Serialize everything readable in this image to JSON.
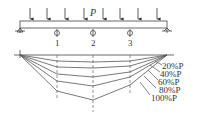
{
  "diagram": {
    "type": "beam-deflection",
    "load_label": "P",
    "point_labels": [
      "1",
      "2",
      "3"
    ],
    "curve_labels": [
      "20%P",
      "40%P",
      "60%P",
      "80%P",
      "100%P"
    ],
    "line_color": "#555555",
    "curves": [
      {
        "label": "20%P",
        "depths": [
          6,
          7,
          6
        ]
      },
      {
        "label": "40%P",
        "depths": [
          12,
          13,
          11
        ]
      },
      {
        "label": "60%P",
        "depths": [
          19,
          22,
          17
        ]
      },
      {
        "label": "80%P",
        "depths": [
          26,
          31,
          22
        ]
      },
      {
        "label": "100%P",
        "depths": [
          36,
          45,
          30
        ]
      }
    ]
  }
}
